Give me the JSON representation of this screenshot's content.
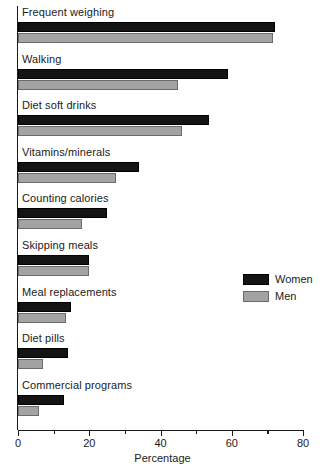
{
  "chart_data": {
    "type": "bar",
    "orientation": "horizontal",
    "title": "",
    "xlabel": "Percentage",
    "ylabel": "",
    "xlim": [
      0,
      80
    ],
    "xticks": [
      0,
      20,
      40,
      60,
      80
    ],
    "xticklabels": [
      "0",
      "20",
      "40",
      "60",
      "80"
    ],
    "xminorticks": [
      10,
      30,
      50,
      70
    ],
    "grid": false,
    "legend_position": "center-right",
    "categories": [
      "Frequent weighing",
      "Walking",
      "Diet soft drinks",
      "Vitamins/minerals",
      "Counting calories",
      "Skipping meals",
      "Meal replacements",
      "Diet pills",
      "Commercial programs"
    ],
    "series": [
      {
        "name": "Women",
        "color": "#141414",
        "values": [
          72,
          59,
          53.5,
          34,
          25,
          20,
          15,
          14,
          13
        ]
      },
      {
        "name": "Men",
        "color": "#a3a3a3",
        "values": [
          71.5,
          45,
          46,
          27.5,
          18,
          20,
          13.5,
          7,
          6
        ]
      }
    ]
  },
  "legend": {
    "entries": [
      {
        "label": "Women",
        "swatch": "women"
      },
      {
        "label": "Men",
        "swatch": "men"
      }
    ]
  }
}
